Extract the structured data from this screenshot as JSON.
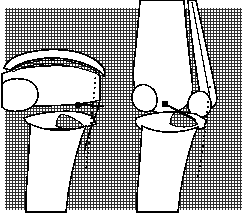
{
  "figure": {
    "title": "Knee joint ACL graft illustration",
    "kind": "medical-line-drawing",
    "canvas": {
      "width": 247,
      "height": 218
    },
    "colors": {
      "ink": "#000000",
      "paper": "#ffffff",
      "hatch": "#3a3a3a",
      "hatch_field": "#ffffff"
    },
    "background": {
      "name": "crosshatch-field",
      "inset_left": 5,
      "inset_top": 8,
      "inset_right": 5,
      "inset_bottom": 8,
      "pitch_px": 3,
      "line_width_px": 1
    },
    "panels": [
      {
        "id": "left",
        "name": "lateral-view",
        "label": "Lateral view of knee",
        "bone_fill": "#ffffff",
        "features": [
          "patella",
          "patellar-tendon-graft-strip",
          "femoral-condyle",
          "tibial-plateau",
          "tibia-shaft",
          "tunnel-dotted-line",
          "guide-pin-marker"
        ]
      },
      {
        "id": "right",
        "name": "anterior-view",
        "label": "Anterior oblique view of knee",
        "bone_fill": "#ffffff",
        "features": [
          "distal-femur",
          "graft-strip",
          "femoral-condyles",
          "tibial-plateau",
          "tibia-shaft",
          "tunnel-dotted-line",
          "guide-pin-marker"
        ]
      }
    ],
    "markers": [
      {
        "name": "guide-pin-left",
        "cx": 78,
        "cy": 105,
        "r": 3.2,
        "line_to_x": 104,
        "line_to_y": 106
      },
      {
        "name": "guide-pin-right",
        "cx": 165,
        "cy": 104,
        "r": 3.4,
        "line_to_x": 196,
        "line_to_y": 120
      }
    ],
    "dotted_lines": [
      {
        "name": "tunnel-path-left",
        "x1": 96,
        "y1": 72,
        "x2": 86,
        "y2": 172,
        "dash": "2 3"
      },
      {
        "name": "tunnel-path-right",
        "x1": 210,
        "y1": 86,
        "x2": 198,
        "y2": 178,
        "dash": "2 3"
      }
    ]
  }
}
